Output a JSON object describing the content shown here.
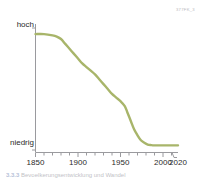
{
  "figure": {
    "id_label": "377FK_3",
    "caption": "Bevoelkerungsentwicklung und Wandel"
  },
  "chart_data": {
    "type": "line",
    "title": "",
    "subtitle": "",
    "xlabel": "",
    "ylabel": "",
    "xlim": [
      1850,
      2020
    ],
    "ylim": [
      0,
      100
    ],
    "grid": false,
    "legend": null,
    "axis_break_before_last_tick": true,
    "y_axis": {
      "tick_labels": [
        "hoch",
        "niedrig"
      ],
      "high_label": "hoch",
      "low_label": "niedrig",
      "numeric_ticks": [
        100,
        0
      ]
    },
    "x_axis": {
      "tick_labels": [
        "1850",
        "1900",
        "1950",
        "2000",
        "2020"
      ],
      "labeled_ticks": [
        1850,
        1900,
        1950,
        2000,
        2020
      ],
      "minor_tick_interval": 10,
      "minor_ticks": [
        1850,
        1860,
        1870,
        1880,
        1890,
        1900,
        1910,
        1920,
        1930,
        1940,
        1950,
        1960,
        1970,
        1980,
        1990,
        2000,
        2010,
        2020
      ]
    },
    "series": [
      {
        "name": "Verlauf",
        "color": "#a8b56a",
        "x": [
          1850,
          1860,
          1870,
          1875,
          1880,
          1885,
          1890,
          1895,
          1900,
          1905,
          1910,
          1915,
          1920,
          1925,
          1930,
          1935,
          1940,
          1945,
          1950,
          1955,
          1958,
          1962,
          1966,
          1970,
          1974,
          1978,
          1982,
          1986,
          1990,
          2000,
          2010,
          2020
        ],
        "values": [
          95,
          95,
          94,
          93,
          91,
          87,
          83,
          79,
          75,
          71,
          68,
          65,
          62,
          58,
          54,
          50,
          46,
          43,
          40,
          36,
          31,
          24,
          17,
          12,
          8,
          6,
          4.5,
          4,
          3.8,
          3.8,
          3.8,
          3.8
        ]
      }
    ]
  }
}
